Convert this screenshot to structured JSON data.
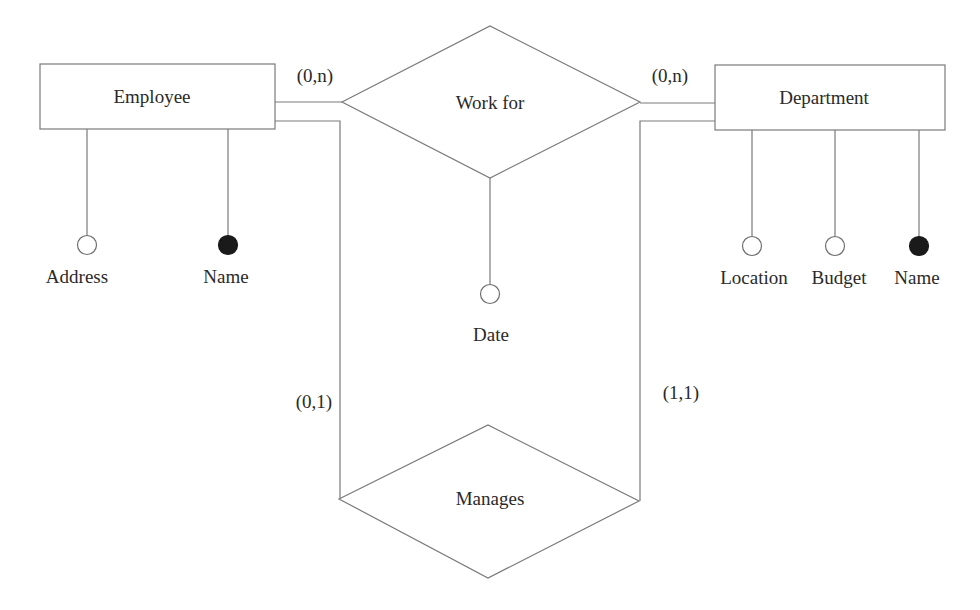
{
  "diagram": {
    "type": "er-diagram",
    "entities": [
      {
        "id": "employee",
        "label": "Employee",
        "attributes": [
          {
            "label": "Address",
            "key": false
          },
          {
            "label": "Name",
            "key": true
          }
        ]
      },
      {
        "id": "department",
        "label": "Department",
        "attributes": [
          {
            "label": "Location",
            "key": false
          },
          {
            "label": "Budget",
            "key": false
          },
          {
            "label": "Name",
            "key": true
          }
        ]
      }
    ],
    "relationships": [
      {
        "id": "work_for",
        "label": "Work for",
        "attributes": [
          {
            "label": "Date",
            "key": false
          }
        ],
        "cardinality": {
          "employee": "(0,n)",
          "department": "(0,n)"
        }
      },
      {
        "id": "manages",
        "label": "Manages",
        "attributes": [],
        "cardinality": {
          "employee": "(0,1)",
          "department": "(1,1)"
        }
      }
    ],
    "legend": {
      "key_attribute": "filled-circle",
      "attribute": "open-circle"
    }
  }
}
